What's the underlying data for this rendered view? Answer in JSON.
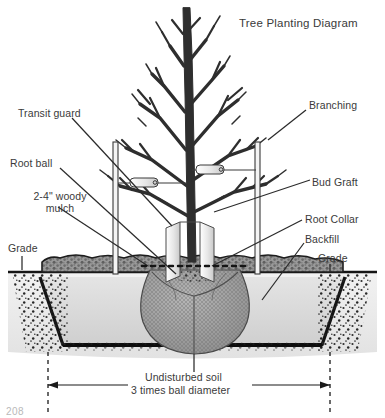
{
  "diagram": {
    "title": "Tree Planting Diagram",
    "page_number": "208",
    "colors": {
      "ink": "#2b2b2b",
      "tree": "#2e2e2e",
      "mulch": "#8f8f8f",
      "backfill": "#d8d8d8",
      "rootball": "#9a9a9a",
      "subsoil": "#eaeaea",
      "soil_line": "#1a1a1a"
    },
    "labels_left": [
      {
        "id": "transit-guard",
        "text": "Transit guard",
        "x": 18,
        "y": 108
      },
      {
        "id": "root-ball",
        "text": "Root ball",
        "x": 10,
        "y": 158
      },
      {
        "id": "woody-mulch",
        "text": "2-4\" woody\nmulch",
        "x": 8,
        "y": 191
      },
      {
        "id": "grade-left",
        "text": "Grade",
        "x": 8,
        "y": 243
      }
    ],
    "labels_right": [
      {
        "id": "branching",
        "text": "Branching",
        "x": 309,
        "y": 100
      },
      {
        "id": "bud-graft",
        "text": "Bud Graft",
        "x": 312,
        "y": 177
      },
      {
        "id": "root-collar",
        "text": "Root Collar",
        "x": 305,
        "y": 214
      },
      {
        "id": "backfill",
        "text": "Backfill",
        "x": 305,
        "y": 234
      },
      {
        "id": "grade-right",
        "text": "Grade",
        "x": 318,
        "y": 253
      }
    ],
    "labels_bottom": [
      {
        "id": "undisturbed-soil",
        "text": "Undisturbed soil",
        "x": 145,
        "y": 377
      },
      {
        "id": "ball-diameter-dim",
        "text": "3 times ball diameter",
        "x": 131,
        "y": 389
      }
    ]
  }
}
